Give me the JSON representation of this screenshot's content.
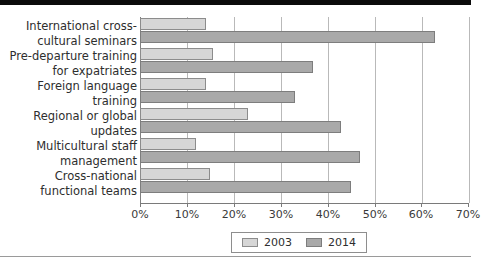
{
  "chart_data": {
    "type": "bar",
    "orientation": "horizontal",
    "title": "",
    "xlabel": "",
    "ylabel": "",
    "xlim": [
      0,
      70
    ],
    "xticks": [
      0,
      10,
      20,
      30,
      40,
      50,
      60,
      70
    ],
    "xtick_labels": [
      "0%",
      "10%",
      "20%",
      "30%",
      "40%",
      "50%",
      "60%",
      "70%"
    ],
    "grid": true,
    "grid_axis": "x",
    "legend_position": "bottom-center",
    "categories": [
      "International cross-cultural seminars",
      "Pre-departure training for expatriates",
      "Foreign language training",
      "Regional or global updates",
      "Multicultural staff management",
      "Cross-national functional teams"
    ],
    "category_lines": [
      [
        "International cross-",
        "cultural seminars"
      ],
      [
        "Pre-departure training",
        "for expatriates"
      ],
      [
        "Foreign language",
        "training"
      ],
      [
        "Regional or global",
        "updates"
      ],
      [
        "Multicultural staff",
        "management"
      ],
      [
        "Cross-national",
        "functional teams"
      ]
    ],
    "series": [
      {
        "name": "2003",
        "color": "#d6d6d6",
        "values": [
          14,
          15.5,
          14,
          23,
          12,
          15
        ]
      },
      {
        "name": "2014",
        "color": "#a9a9a9",
        "values": [
          63,
          37,
          33,
          43,
          47,
          45
        ]
      }
    ]
  },
  "legend": {
    "entries": [
      {
        "label": "2003"
      },
      {
        "label": "2014"
      }
    ]
  }
}
